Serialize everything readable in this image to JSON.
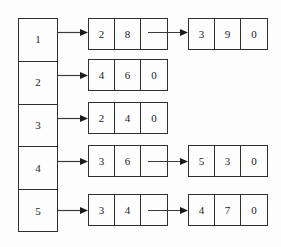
{
  "diagram": {
    "background_color": "#fdfdfd",
    "line_color": "#2e2e2e",
    "text_color": "#1b1b1b",
    "bucket_column": {
      "name": "bucket-index-column",
      "cells": [
        {
          "label": "1"
        },
        {
          "label": "2"
        },
        {
          "label": "3"
        },
        {
          "label": "4"
        },
        {
          "label": "5"
        }
      ]
    },
    "rows": [
      {
        "bucket": "1",
        "nodes": [
          {
            "cells": [
              "2",
              "8",
              ""
            ],
            "has_next_pointer": true
          },
          {
            "cells": [
              "3",
              "9",
              "0"
            ],
            "has_next_pointer": false
          }
        ]
      },
      {
        "bucket": "2",
        "nodes": [
          {
            "cells": [
              "4",
              "6",
              "0"
            ],
            "has_next_pointer": false
          }
        ]
      },
      {
        "bucket": "3",
        "nodes": [
          {
            "cells": [
              "2",
              "4",
              "0"
            ],
            "has_next_pointer": false
          }
        ]
      },
      {
        "bucket": "4",
        "nodes": [
          {
            "cells": [
              "3",
              "6",
              ""
            ],
            "has_next_pointer": true
          },
          {
            "cells": [
              "5",
              "3",
              "0"
            ],
            "has_next_pointer": false
          }
        ]
      },
      {
        "bucket": "5",
        "nodes": [
          {
            "cells": [
              "3",
              "4",
              ""
            ],
            "has_next_pointer": true
          },
          {
            "cells": [
              "4",
              "7",
              "0"
            ],
            "has_next_pointer": false
          }
        ]
      }
    ]
  }
}
